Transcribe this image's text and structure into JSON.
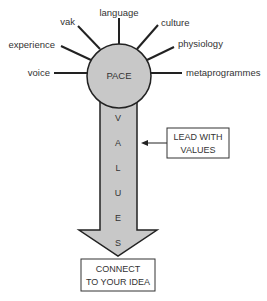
{
  "diagram": {
    "center_label": "PACE",
    "spokes": [
      {
        "label": "voice"
      },
      {
        "label": "experience"
      },
      {
        "label": "vak"
      },
      {
        "label": "language"
      },
      {
        "label": "culture"
      },
      {
        "label": "physiology"
      },
      {
        "label": "metaprogrammes"
      }
    ],
    "arrow_letters": [
      "V",
      "A",
      "L",
      "U",
      "E",
      "S"
    ],
    "side_box": {
      "line1": "LEAD WITH",
      "line2": "VALUES"
    },
    "bottom_box": {
      "line1": "CONNECT",
      "line2": "TO YOUR IDEA"
    },
    "colors": {
      "fill": "#c8c8c8",
      "stroke": "#222222",
      "text": "#333333"
    }
  }
}
